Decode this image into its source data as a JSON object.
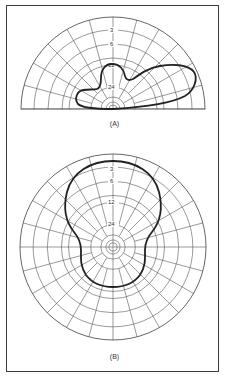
{
  "figure": {
    "panel_a": {
      "caption": "(A)",
      "type": "semicircular polar plot",
      "ring_labels": [
        "3",
        "6",
        "12",
        "24"
      ],
      "center": [
        113,
        109
      ],
      "outer_radius": 92
    },
    "panel_b": {
      "caption": "(B)",
      "type": "full circular polar plot",
      "ring_labels": [
        "3",
        "6",
        "12",
        "24"
      ],
      "center": [
        113,
        247
      ],
      "outer_radius": 93
    }
  },
  "colors": {
    "grid": "#555555",
    "pattern": "#222222",
    "frame": "#3a3a3a",
    "background": "#ffffff"
  },
  "chart_data": [
    {
      "type": "polar",
      "title": "(A)",
      "description": "Elevation radiation pattern (semicircle), dB scale",
      "rings_db": [
        0,
        -3,
        -6,
        -12,
        -24
      ],
      "ring_labels": [
        "3",
        "6",
        "12",
        "24"
      ],
      "angular_grid_deg": 15,
      "range_deg": [
        0,
        180
      ],
      "lobes": [
        {
          "name": "main lobe",
          "direction_deg": 20,
          "level_db": 0
        },
        {
          "name": "second lobe",
          "direction_deg": 85,
          "level_db": -12
        },
        {
          "name": "back lobe",
          "direction_deg": 160,
          "level_db": -20
        }
      ]
    },
    {
      "type": "polar",
      "title": "(B)",
      "description": "Azimuth radiation pattern (full circle), dB scale",
      "rings_db": [
        0,
        -3,
        -6,
        -12,
        -24
      ],
      "ring_labels": [
        "3",
        "6",
        "12",
        "24"
      ],
      "angular_grid_deg": 15,
      "range_deg": [
        0,
        360
      ],
      "lobes": [
        {
          "name": "forward lobe",
          "direction_deg": 90,
          "level_db": -1
        },
        {
          "name": "rear lobe",
          "direction_deg": 270,
          "level_db": -13
        }
      ]
    }
  ]
}
